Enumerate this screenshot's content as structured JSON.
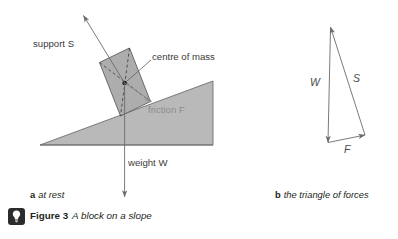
{
  "figure": {
    "badge_icon": "lightbulb-icon",
    "number_label": "Figure 3",
    "title": "A block on a slope"
  },
  "panel_a": {
    "caption_letter": "a",
    "caption_text": "at rest",
    "labels": {
      "support": "support S",
      "centre_of_mass": "centre of mass",
      "friction": "friction F",
      "weight": "weight W"
    },
    "colors": {
      "slope_fill": "#b9b9b9",
      "block_fill": "#a6a6a6",
      "stroke": "#5e5e5e",
      "friction_text": "#8d8d8d",
      "label_text": "#3b3b3b"
    }
  },
  "panel_b": {
    "caption_letter": "b",
    "caption_text": "the triangle of forces",
    "labels": {
      "weight": "W",
      "support": "S",
      "friction": "F"
    },
    "colors": {
      "arrow_stroke": "#6b6b6b",
      "label_text": "#4a4a4a"
    }
  }
}
